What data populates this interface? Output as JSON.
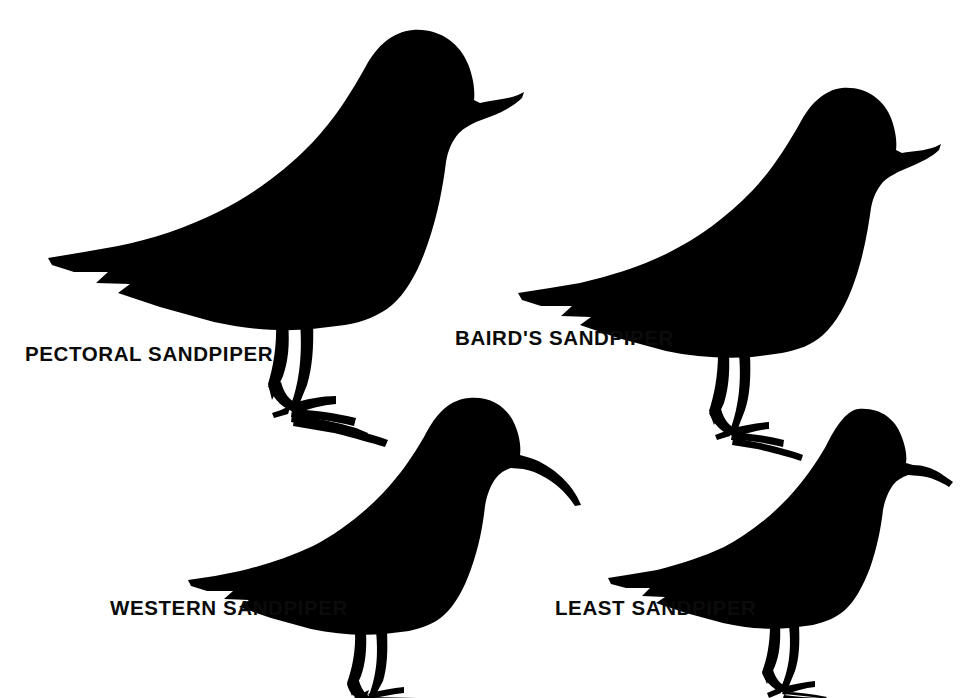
{
  "plate": {
    "title": "Sandpiper Silhouettes",
    "background_color": "#ffffff",
    "ink_color": "#000000",
    "width": 973,
    "height": 698
  },
  "birds": [
    {
      "id": "pectoral-sandpiper",
      "label": "PECTORAL SANDPIPER",
      "position": "top-left",
      "size_rank": "largest",
      "bill": "straight, medium-long, slightly drooping at tip",
      "notes": "bulky body, rounded head, long legs, long splayed toes"
    },
    {
      "id": "bairds-sandpiper",
      "label": "BAIRD'S SANDPIPER",
      "position": "top-right",
      "size_rank": "large",
      "bill": "straight, medium, fine tipped",
      "notes": "long attenuated rear end, wingtips extend well past tail"
    },
    {
      "id": "western-sandpiper",
      "label": "WESTERN SANDPIPER",
      "position": "bottom-left",
      "size_rank": "small",
      "bill": "long, decurved, drooping at tip",
      "notes": "compact body, steep forehead, longest bill of the small peeps"
    },
    {
      "id": "least-sandpiper",
      "label": "LEAST SANDPIPER",
      "position": "bottom-right",
      "size_rank": "smallest",
      "bill": "short, fine, slightly drooped",
      "notes": "smallest, rounded body, short legs, shortest bill"
    }
  ]
}
